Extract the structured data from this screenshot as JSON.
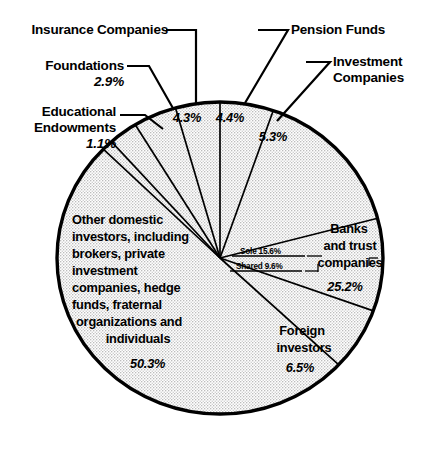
{
  "chart_data": {
    "type": "pie",
    "title": "",
    "subtitle": "",
    "xlabel": "",
    "ylabel": "",
    "legend_position": "none",
    "grid": false,
    "units": "percent",
    "total": 100.0,
    "categories": [
      "Educational Endowments",
      "Foundations",
      "Insurance Companies",
      "Pension Funds",
      "Investment Companies",
      "Banks and trust companies",
      "Foreign investors",
      "Other domestic investors, including brokers, private investment companies, hedge funds, fraternal organizations and individuals"
    ],
    "values": [
      1.1,
      2.9,
      4.3,
      4.4,
      5.3,
      25.2,
      6.5,
      50.3
    ],
    "slices": [
      {
        "label": "Educational Endowments",
        "value": 1.1,
        "value_label": "1.1%",
        "label_placement": "callout-left"
      },
      {
        "label": "Foundations",
        "value": 2.9,
        "value_label": "2.9%",
        "label_placement": "callout-left"
      },
      {
        "label": "Insurance Companies",
        "value": 4.3,
        "value_label": "4.3%",
        "label_placement": "callout-top-left"
      },
      {
        "label": "Pension Funds",
        "value": 4.4,
        "value_label": "4.4%",
        "label_placement": "callout-top-right"
      },
      {
        "label": "Investment Companies",
        "value": 5.3,
        "value_label": "5.3%",
        "label_placement": "callout-right"
      },
      {
        "label": "Banks and trust companies",
        "value": 25.2,
        "value_label": "25.2%",
        "label_placement": "inside-right",
        "subdivisions": [
          {
            "label": "Sole",
            "value": 15.6,
            "value_label": "15.6%",
            "text": "Sole 15.6%"
          },
          {
            "label": "Shared",
            "value": 9.6,
            "value_label": "9.6%",
            "text": "Shared 9.6%"
          }
        ]
      },
      {
        "label": "Foreign investors",
        "value": 6.5,
        "value_label": "6.5%",
        "label_placement": "inside-bottom-right"
      },
      {
        "label": "Other domestic investors, including brokers, private investment companies, hedge funds, fraternal organizations and individuals",
        "value": 50.3,
        "value_label": "50.3%",
        "label_placement": "inside-left"
      }
    ],
    "colors": {
      "slice_fill": "#e3e3e3",
      "slice_stroke": "#000000",
      "outline": "#000000",
      "background": "#ffffff",
      "text": "#000000"
    }
  },
  "callouts": {
    "insurance_companies": "Insurance Companies",
    "pension_funds": "Pension Funds",
    "foundations": "Foundations",
    "foundations_pct": "2.9%",
    "investment_companies_line1": "Investment",
    "investment_companies_line2": "Companies",
    "educational_endowments_line1": "Educational",
    "educational_endowments_line2": "Endowments",
    "educational_endowments_pct": "1.1%"
  },
  "in_pie": {
    "insurance_pct": "4.3%",
    "pension_pct": "4.4%",
    "investment_pct": "5.3%",
    "banks_line1": "Banks",
    "banks_line2": "and trust",
    "banks_line3": "companies",
    "banks_pct": "25.2%",
    "sole": "Sole 15.6%",
    "shared": "Shared 9.6%",
    "foreign_line1": "Foreign",
    "foreign_line2": "investors",
    "foreign_pct": "6.5%",
    "other_line1": "Other domestic",
    "other_line2": "investors, including",
    "other_line3": "brokers, private",
    "other_line4": "investment",
    "other_line5": "companies, hedge",
    "other_line6": "funds, fraternal",
    "other_line7": "organizations and",
    "other_line8": "individuals",
    "other_pct": "50.3%"
  }
}
